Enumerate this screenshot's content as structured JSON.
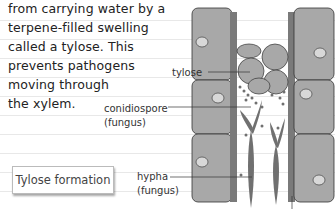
{
  "paragraph": {
    "lines": [
      "from carrying water by a",
      "terpene-filled swelling",
      "called a tylose. This",
      "prevents pathogens",
      "moving through",
      "the xylem."
    ]
  },
  "labels": {
    "tylose": "tylose",
    "conidiospore": "conidiospore",
    "conidiospore_kind": "(fungus)",
    "hypha": "hypha",
    "hypha_kind": "(fungus)"
  },
  "caption": "Tylose formation",
  "colors": {
    "cell_fill": "#a8a8a8",
    "cell_wall": "#7a7a7a",
    "nucleus": "#d8d8d8",
    "fungus": "#707070",
    "text": "#222222"
  }
}
